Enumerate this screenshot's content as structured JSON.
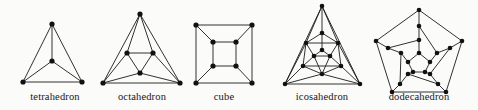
{
  "figure": {
    "background_color": "#fbfbf9",
    "ink_color": "#111111",
    "width": 478,
    "height": 110
  },
  "labels": {
    "tetrahedron": "tetrahedron",
    "octahedron": "octahedron",
    "cube": "cube",
    "icosahedron": "icosahedron",
    "dodecahedron": "dodecahedron"
  },
  "label_positions": [
    {
      "key": "tetrahedron",
      "x": 55,
      "y": 100
    },
    {
      "key": "octahedron",
      "x": 142,
      "y": 100
    },
    {
      "key": "cube",
      "x": 224,
      "y": 100
    },
    {
      "key": "icosahedron",
      "x": 322,
      "y": 100
    },
    {
      "key": "dodecahedron",
      "x": 419,
      "y": 100
    }
  ],
  "graphs": [
    {
      "name": "tetrahedron",
      "vertex_count": 4,
      "edge_count": 6,
      "vertices": [
        [
          52,
          24
        ],
        [
          52,
          61
        ],
        [
          23,
          82
        ],
        [
          82,
          82
        ]
      ],
      "edges": [
        [
          0,
          1
        ],
        [
          0,
          2
        ],
        [
          0,
          3
        ],
        [
          1,
          2
        ],
        [
          1,
          3
        ],
        [
          2,
          3
        ]
      ]
    },
    {
      "name": "octahedron",
      "vertex_count": 6,
      "edge_count": 12,
      "vertices": [
        [
          140,
          14
        ],
        [
          103,
          83
        ],
        [
          180,
          83
        ],
        [
          127,
          53
        ],
        [
          153,
          53
        ],
        [
          140,
          73
        ]
      ],
      "edges": [
        [
          0,
          1
        ],
        [
          0,
          2
        ],
        [
          1,
          2
        ],
        [
          3,
          4
        ],
        [
          4,
          5
        ],
        [
          5,
          3
        ],
        [
          0,
          3
        ],
        [
          0,
          4
        ],
        [
          1,
          3
        ],
        [
          1,
          5
        ],
        [
          2,
          4
        ],
        [
          2,
          5
        ]
      ]
    },
    {
      "name": "cube",
      "vertex_count": 8,
      "edge_count": 12,
      "vertices": [
        [
          196,
          25
        ],
        [
          252,
          25
        ],
        [
          252,
          83
        ],
        [
          196,
          83
        ],
        [
          213,
          42
        ],
        [
          236,
          42
        ],
        [
          236,
          66
        ],
        [
          213,
          66
        ]
      ],
      "edges": [
        [
          0,
          1
        ],
        [
          1,
          2
        ],
        [
          2,
          3
        ],
        [
          3,
          0
        ],
        [
          4,
          5
        ],
        [
          5,
          6
        ],
        [
          6,
          7
        ],
        [
          7,
          4
        ],
        [
          0,
          4
        ],
        [
          1,
          5
        ],
        [
          2,
          6
        ],
        [
          3,
          7
        ]
      ]
    },
    {
      "name": "icosahedron",
      "vertex_count": 12,
      "edge_count": 30,
      "vertices": [
        [
          322,
          6
        ],
        [
          285,
          84
        ],
        [
          360,
          84
        ],
        [
          322,
          33
        ],
        [
          303,
          66
        ],
        [
          341,
          66
        ],
        [
          306,
          43
        ],
        [
          338,
          43
        ],
        [
          322,
          50
        ],
        [
          330,
          56
        ],
        [
          314,
          56
        ],
        [
          322,
          74
        ]
      ],
      "edges": [
        [
          0,
          1
        ],
        [
          1,
          2
        ],
        [
          2,
          0
        ],
        [
          0,
          3
        ],
        [
          0,
          6
        ],
        [
          0,
          7
        ],
        [
          1,
          4
        ],
        [
          1,
          6
        ],
        [
          1,
          11
        ],
        [
          2,
          5
        ],
        [
          2,
          7
        ],
        [
          2,
          11
        ],
        [
          3,
          6
        ],
        [
          3,
          7
        ],
        [
          3,
          8
        ],
        [
          6,
          10
        ],
        [
          7,
          9
        ],
        [
          6,
          4
        ],
        [
          7,
          5
        ],
        [
          4,
          10
        ],
        [
          5,
          9
        ],
        [
          4,
          11
        ],
        [
          5,
          11
        ],
        [
          4,
          5
        ],
        [
          8,
          9
        ],
        [
          8,
          10
        ],
        [
          9,
          10
        ],
        [
          9,
          11
        ],
        [
          10,
          11
        ],
        [
          6,
          7
        ]
      ]
    },
    {
      "name": "dodecahedron",
      "vertex_count": 20,
      "edge_count": 30,
      "vertices": [
        [
          419,
          10
        ],
        [
          462,
          41
        ],
        [
          446,
          92
        ],
        [
          392,
          92
        ],
        [
          376,
          41
        ],
        [
          419,
          26
        ],
        [
          450,
          48
        ],
        [
          438,
          84
        ],
        [
          400,
          84
        ],
        [
          388,
          48
        ],
        [
          419,
          40
        ],
        [
          437,
          53
        ],
        [
          430,
          74
        ],
        [
          408,
          74
        ],
        [
          401,
          53
        ],
        [
          419,
          53
        ],
        [
          430,
          62
        ],
        [
          425,
          72
        ],
        [
          413,
          72
        ],
        [
          408,
          62
        ]
      ],
      "edges": [
        [
          0,
          1
        ],
        [
          1,
          2
        ],
        [
          2,
          3
        ],
        [
          3,
          4
        ],
        [
          4,
          0
        ],
        [
          0,
          5
        ],
        [
          1,
          6
        ],
        [
          2,
          7
        ],
        [
          3,
          8
        ],
        [
          4,
          9
        ],
        [
          5,
          10
        ],
        [
          5,
          11
        ],
        [
          6,
          11
        ],
        [
          6,
          12
        ],
        [
          7,
          12
        ],
        [
          7,
          13
        ],
        [
          8,
          13
        ],
        [
          8,
          14
        ],
        [
          9,
          14
        ],
        [
          9,
          10
        ],
        [
          10,
          15
        ],
        [
          11,
          16
        ],
        [
          12,
          17
        ],
        [
          13,
          18
        ],
        [
          14,
          19
        ],
        [
          15,
          16
        ],
        [
          16,
          17
        ],
        [
          17,
          18
        ],
        [
          18,
          19
        ],
        [
          19,
          15
        ]
      ]
    }
  ]
}
